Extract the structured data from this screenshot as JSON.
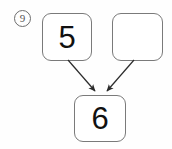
{
  "item": {
    "number_label": "9",
    "marker_style": "circled"
  },
  "diagram": {
    "type": "number-bond-addition",
    "boxes": [
      {
        "role": "addend-left",
        "value": "5",
        "empty": false
      },
      {
        "role": "addend-right",
        "value": "",
        "empty": true
      },
      {
        "role": "sum",
        "value": "6",
        "empty": false
      }
    ],
    "arrows": [
      {
        "from": "addend-left",
        "to": "sum",
        "head": "filled-triangle"
      },
      {
        "from": "addend-right",
        "to": "sum",
        "head": "filled-triangle"
      }
    ],
    "colors": {
      "box_border": "#7a7a7a",
      "digit": "#111111",
      "arrow": "#2b2b2b",
      "marker_border": "#6d6d6d",
      "background": "#fefefe"
    }
  }
}
